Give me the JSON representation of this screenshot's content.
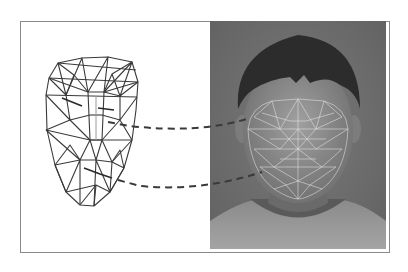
{
  "figure": {
    "panels": [
      {
        "name": "wireframe-model",
        "label": ""
      },
      {
        "name": "face-photo-with-mesh",
        "label": ""
      }
    ],
    "connectors": [
      {
        "name": "eye-region-correspondence",
        "style": "dashed"
      },
      {
        "name": "mouth-region-correspondence",
        "style": "dashed"
      }
    ],
    "colors": {
      "frame_border": "#8a8a8a",
      "wire_line": "#3a3a3a",
      "photo_background": "#6f6f6f",
      "hair": "#2a2a2a",
      "skin": "#8c8c8c",
      "mesh_overlay": "#e8e8e8",
      "shirt": "#9a9a9a",
      "connector": "#3a3a3a"
    }
  }
}
